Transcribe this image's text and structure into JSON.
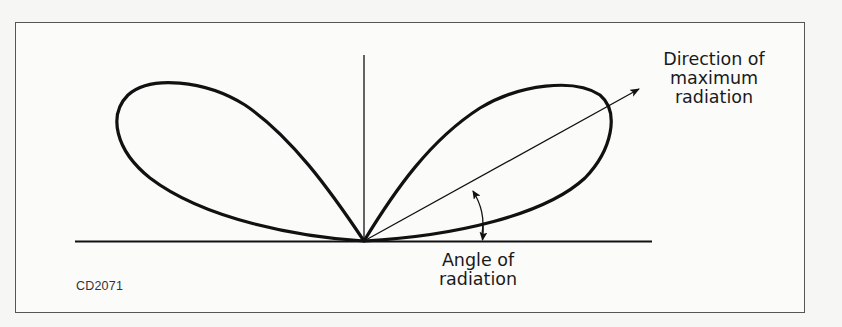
{
  "header_fragment": "",
  "diagram": {
    "type": "antenna-radiation-pattern",
    "labels": {
      "direction_line1": "Direction of",
      "direction_line2": "maximum",
      "direction_line3": "radiation",
      "angle_line1": "Angle of",
      "angle_line2": "radiation"
    },
    "figure_id": "CD2071",
    "colors": {
      "stroke": "#111111",
      "frame": "#555555",
      "background": "#fbfbfa"
    }
  }
}
